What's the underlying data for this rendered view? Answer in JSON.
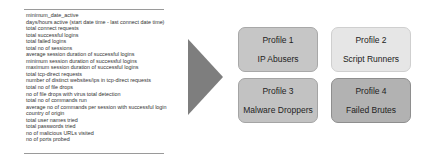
{
  "features": [
    "minimum_date_active",
    "days/hours active (start date time - last connect date time)",
    "total connect requests",
    "total successful logins",
    "total failed logins",
    "total no of sessions",
    "average session duration of successful logins",
    "minimum session duration of successful logins",
    "maximum session duration of successful logins",
    "total tcp-direct requests",
    "number of distinct websites/ips in tcp-direct requests",
    "total no of file drops",
    "no of file drops with virus total detection",
    "total no of commands run",
    "average no of commands per session with successful login",
    "country of origin",
    "total user names tried",
    "total passwords tried",
    "no of malicious URLs visited",
    "no of ports probed"
  ],
  "profiles": [
    {
      "number": "Profile 1",
      "name": "IP Abusers"
    },
    {
      "number": "Profile 2",
      "name": "Script Runners"
    },
    {
      "number": "Profile 3",
      "name": "Malware Droppers"
    },
    {
      "number": "Profile 4",
      "name": "Failed Brutes"
    }
  ]
}
